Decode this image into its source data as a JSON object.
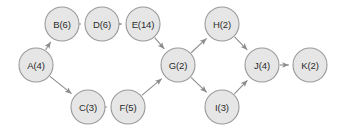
{
  "diagram": {
    "type": "directed-acyclic-graph",
    "background_color": "#ffffff",
    "node_fill_color": "#e6e6e6",
    "node_border_color": "#9a9a9a",
    "edge_color": "#8c8c8c",
    "label_color": "#2b2b2b",
    "node_radius": 17,
    "canvas": {
      "width": 347,
      "height": 132
    }
  },
  "nodes": [
    {
      "id": "A",
      "label": "A(4)",
      "name": "A",
      "value": 4,
      "x": 36,
      "y": 65
    },
    {
      "id": "B",
      "label": "B(6)",
      "name": "B",
      "value": 6,
      "x": 62,
      "y": 24
    },
    {
      "id": "D",
      "label": "D(6)",
      "name": "D",
      "value": 6,
      "x": 102,
      "y": 24
    },
    {
      "id": "E",
      "label": "E(14)",
      "name": "E",
      "value": 14,
      "x": 143,
      "y": 24
    },
    {
      "id": "C",
      "label": "C(3)",
      "name": "C",
      "value": 3,
      "x": 88,
      "y": 107
    },
    {
      "id": "F",
      "label": "F(5)",
      "name": "F",
      "value": 5,
      "x": 128,
      "y": 107
    },
    {
      "id": "G",
      "label": "G(2)",
      "name": "G",
      "value": 2,
      "x": 178,
      "y": 65
    },
    {
      "id": "H",
      "label": "H(2)",
      "name": "H",
      "value": 2,
      "x": 222,
      "y": 24
    },
    {
      "id": "I",
      "label": "I(3)",
      "name": "I",
      "value": 3,
      "x": 222,
      "y": 107
    },
    {
      "id": "J",
      "label": "J(4)",
      "name": "J",
      "value": 4,
      "x": 262,
      "y": 65
    },
    {
      "id": "K",
      "label": "K(2)",
      "name": "K",
      "value": 2,
      "x": 310,
      "y": 65
    }
  ],
  "edges": [
    {
      "from": "A",
      "to": "B"
    },
    {
      "from": "A",
      "to": "C"
    },
    {
      "from": "B",
      "to": "D"
    },
    {
      "from": "D",
      "to": "E"
    },
    {
      "from": "E",
      "to": "G"
    },
    {
      "from": "C",
      "to": "F"
    },
    {
      "from": "F",
      "to": "G"
    },
    {
      "from": "G",
      "to": "H"
    },
    {
      "from": "G",
      "to": "I"
    },
    {
      "from": "H",
      "to": "J"
    },
    {
      "from": "I",
      "to": "J"
    },
    {
      "from": "J",
      "to": "K"
    }
  ]
}
